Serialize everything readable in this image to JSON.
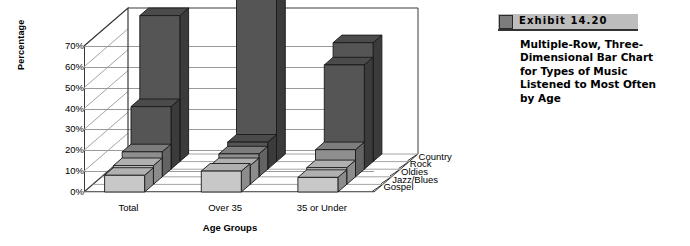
{
  "exhibit": {
    "label": "Exhibit  14.20",
    "caption": "Multiple-Row, Three-Dimensional Bar Chart for Types of Music Listened to Most Often by Age",
    "bar_color": "#bdbdbd",
    "square_color": "#7d7d7d"
  },
  "chart_data": {
    "type": "bar",
    "title": "",
    "subtitle": "",
    "xlabel": "Age Groups",
    "ylabel": "Percentage",
    "zlabel": "",
    "categories": [
      "Total",
      "Over 35",
      "35 or Under"
    ],
    "ylim": [
      0,
      70
    ],
    "ytick_labels": [
      "0%",
      "10%",
      "20%",
      "30%",
      "40%",
      "50%",
      "60%",
      "70%"
    ],
    "ytick_values": [
      0,
      10,
      20,
      30,
      40,
      50,
      60,
      70
    ],
    "grid": true,
    "legend_position": "depth-axis-right",
    "series": [
      {
        "name": "Gospel",
        "values": [
          8,
          10,
          7
        ],
        "color": "#c8c8c8"
      },
      {
        "name": "Jazz/Blues",
        "values": [
          9,
          9,
          8
        ],
        "color": "#c8c8c8"
      },
      {
        "name": "Oldies",
        "values": [
          12,
          11,
          13
        ],
        "color": "#8e8e8e"
      },
      {
        "name": "Rock",
        "values": [
          30,
          13,
          50
        ],
        "color": "#555555"
      },
      {
        "name": "Country",
        "values": [
          70,
          78,
          57
        ],
        "color": "#555555"
      }
    ],
    "series_order_front_to_back": [
      "Gospel",
      "Jazz/Blues",
      "Oldies",
      "Rock",
      "Country"
    ]
  }
}
